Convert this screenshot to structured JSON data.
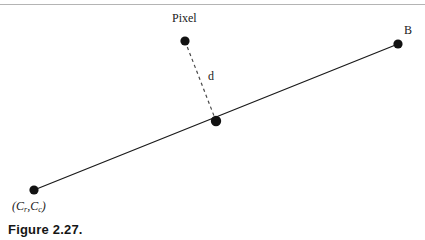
{
  "page": {
    "background_color": "#ffffff",
    "width": 425,
    "height": 240,
    "rule_color": "#b4b4b4"
  },
  "caption": {
    "text": "Figure 2.27."
  },
  "diagram": {
    "type": "geometric-line-diagram",
    "ink_color": "#1a1a1a",
    "labels": {
      "pixel": "Pixel",
      "endpoint_b": "B",
      "distance": "d",
      "endpoint_c_open": "(",
      "endpoint_c_first": "C",
      "endpoint_c_first_sub": "r",
      "endpoint_c_comma": ",",
      "endpoint_c_second": "C",
      "endpoint_c_second_sub": "c",
      "endpoint_c_close": ")"
    },
    "points": [
      {
        "name": "c-endpoint",
        "label": "(Cr,Cc)",
        "x": 34,
        "y": 190,
        "radius": 4.6
      },
      {
        "name": "b-endpoint",
        "label": "B",
        "x": 398,
        "y": 44,
        "radius": 4.6
      },
      {
        "name": "pixel-point",
        "label": "Pixel",
        "x": 185,
        "y": 41,
        "radius": 4.6
      },
      {
        "name": "foot-of-perpendicular",
        "label": "",
        "x": 216,
        "y": 121,
        "radius": 5.2
      }
    ],
    "segments": [
      {
        "name": "line-segment-cb",
        "style": "solid",
        "x1": 34,
        "y1": 190,
        "x2": 398,
        "y2": 44,
        "stroke_width": 1.3
      },
      {
        "name": "distance-segment-d",
        "style": "dashed",
        "x1": 185,
        "y1": 41,
        "x2": 216,
        "y2": 121,
        "stroke_width": 1.2,
        "dash_pattern": "3.2 3.2"
      }
    ]
  }
}
